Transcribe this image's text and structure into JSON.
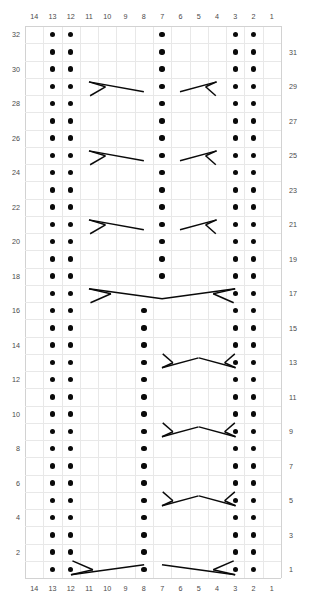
{
  "chart": {
    "type": "knitting-cable-chart",
    "title": "",
    "columns": 14,
    "rows": 32,
    "column_headers_top": [
      14,
      13,
      12,
      11,
      10,
      9,
      8,
      7,
      6,
      5,
      4,
      3,
      2,
      1
    ],
    "column_headers_bottom": [
      14,
      13,
      12,
      11,
      10,
      9,
      8,
      7,
      6,
      5,
      4,
      3,
      2,
      1
    ],
    "row_labels_left": [
      32,
      30,
      28,
      26,
      24,
      22,
      20,
      18,
      16,
      14,
      12,
      10,
      8,
      6,
      4,
      2
    ],
    "row_labels_right": [
      31,
      29,
      27,
      25,
      23,
      21,
      19,
      17,
      15,
      13,
      11,
      9,
      7,
      5,
      3,
      1
    ],
    "reading_direction": "right-to-left",
    "grid_color": "#e8e8e8",
    "symbol_color": "#0a0a0a",
    "legend": [
      {
        "symbol": "dot",
        "name": "purl-stitch"
      },
      {
        "symbol": "cable-fork-right",
        "name": "right-twist-cable"
      },
      {
        "symbol": "cable-fork-left",
        "name": "left-twist-cable"
      }
    ],
    "purl_columns_left": [
      13,
      12
    ],
    "purl_columns_right": [
      3,
      2
    ],
    "center_purl_column_upper": 7,
    "center_purl_column_lower": 8,
    "center_shift_row": 17,
    "cable_rows_short": [
      29,
      25,
      21,
      13,
      9,
      5
    ],
    "cable_rows_long": [
      17,
      1
    ],
    "dots": [
      {
        "row": 32,
        "cols": [
          13,
          12,
          7,
          3,
          2
        ]
      },
      {
        "row": 31,
        "cols": [
          13,
          12,
          7,
          3,
          2
        ]
      },
      {
        "row": 30,
        "cols": [
          13,
          12,
          7,
          3,
          2
        ]
      },
      {
        "row": 29,
        "cols": [
          13,
          12,
          7,
          3,
          2
        ]
      },
      {
        "row": 28,
        "cols": [
          13,
          12,
          7,
          3,
          2
        ]
      },
      {
        "row": 27,
        "cols": [
          13,
          12,
          7,
          3,
          2
        ]
      },
      {
        "row": 26,
        "cols": [
          13,
          12,
          7,
          3,
          2
        ]
      },
      {
        "row": 25,
        "cols": [
          13,
          12,
          7,
          3,
          2
        ]
      },
      {
        "row": 24,
        "cols": [
          13,
          12,
          7,
          3,
          2
        ]
      },
      {
        "row": 23,
        "cols": [
          13,
          12,
          7,
          3,
          2
        ]
      },
      {
        "row": 22,
        "cols": [
          13,
          12,
          7,
          3,
          2
        ]
      },
      {
        "row": 21,
        "cols": [
          13,
          12,
          7,
          3,
          2
        ]
      },
      {
        "row": 20,
        "cols": [
          13,
          12,
          7,
          3,
          2
        ]
      },
      {
        "row": 19,
        "cols": [
          13,
          12,
          7,
          3,
          2
        ]
      },
      {
        "row": 18,
        "cols": [
          13,
          12,
          7,
          3,
          2
        ]
      },
      {
        "row": 17,
        "cols": [
          13,
          12,
          3,
          2
        ]
      },
      {
        "row": 16,
        "cols": [
          13,
          12,
          8,
          3,
          2
        ]
      },
      {
        "row": 15,
        "cols": [
          13,
          12,
          8,
          3,
          2
        ]
      },
      {
        "row": 14,
        "cols": [
          13,
          12,
          8,
          3,
          2
        ]
      },
      {
        "row": 13,
        "cols": [
          13,
          12,
          8,
          3,
          2
        ]
      },
      {
        "row": 12,
        "cols": [
          13,
          12,
          8,
          3,
          2
        ]
      },
      {
        "row": 11,
        "cols": [
          13,
          12,
          8,
          3,
          2
        ]
      },
      {
        "row": 10,
        "cols": [
          13,
          12,
          8,
          3,
          2
        ]
      },
      {
        "row": 9,
        "cols": [
          13,
          12,
          8,
          3,
          2
        ]
      },
      {
        "row": 8,
        "cols": [
          13,
          12,
          8,
          3,
          2
        ]
      },
      {
        "row": 7,
        "cols": [
          13,
          12,
          8,
          3,
          2
        ]
      },
      {
        "row": 6,
        "cols": [
          13,
          12,
          8,
          3,
          2
        ]
      },
      {
        "row": 5,
        "cols": [
          13,
          12,
          8,
          3,
          2
        ]
      },
      {
        "row": 4,
        "cols": [
          13,
          12,
          8,
          3,
          2
        ]
      },
      {
        "row": 3,
        "cols": [
          13,
          12,
          8,
          3,
          2
        ]
      },
      {
        "row": 2,
        "cols": [
          13,
          12,
          8,
          3,
          2
        ]
      },
      {
        "row": 1,
        "cols": [
          13,
          12,
          8,
          3,
          2
        ]
      }
    ],
    "symbols": [
      {
        "row": 29,
        "kind": "fork-right-up",
        "col_start": 11,
        "col_end": 8
      },
      {
        "row": 29,
        "kind": "fork-left-up",
        "col_start": 6,
        "col_end": 4
      },
      {
        "row": 25,
        "kind": "fork-right-up",
        "col_start": 11,
        "col_end": 8
      },
      {
        "row": 25,
        "kind": "fork-left-up",
        "col_start": 6,
        "col_end": 4
      },
      {
        "row": 21,
        "kind": "fork-right-up",
        "col_start": 11,
        "col_end": 8
      },
      {
        "row": 21,
        "kind": "fork-left-up",
        "col_start": 6,
        "col_end": 4
      },
      {
        "row": 17,
        "kind": "fork-right-up-long",
        "col_start": 11,
        "col_end": 7
      },
      {
        "row": 17,
        "kind": "fork-left-up-long",
        "col_start": 7,
        "col_end": 3
      },
      {
        "row": 13,
        "kind": "fork-right-down",
        "col_start": 7,
        "col_end": 5
      },
      {
        "row": 13,
        "kind": "fork-left-down",
        "col_start": 5,
        "col_end": 3
      },
      {
        "row": 9,
        "kind": "fork-right-down",
        "col_start": 7,
        "col_end": 5
      },
      {
        "row": 9,
        "kind": "fork-left-down",
        "col_start": 5,
        "col_end": 3
      },
      {
        "row": 5,
        "kind": "fork-right-down",
        "col_start": 7,
        "col_end": 5
      },
      {
        "row": 5,
        "kind": "fork-left-down",
        "col_start": 5,
        "col_end": 3
      },
      {
        "row": 1,
        "kind": "fork-right-down-long",
        "col_start": 12,
        "col_end": 8
      },
      {
        "row": 1,
        "kind": "fork-left-down-long",
        "col_start": 7,
        "col_end": 3
      }
    ]
  }
}
